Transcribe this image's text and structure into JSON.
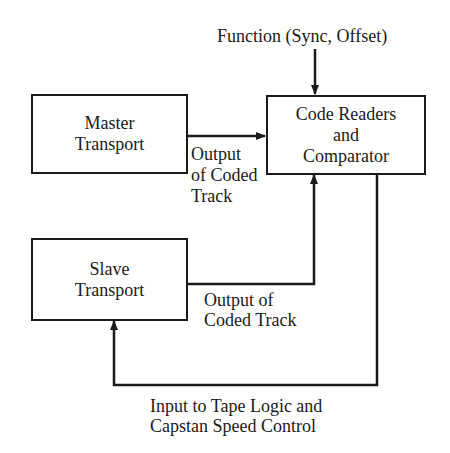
{
  "diagram": {
    "line_color": "#1a1a1a",
    "nodes": [
      {
        "id": "master",
        "lines": [
          "Master",
          "Transport"
        ]
      },
      {
        "id": "code",
        "lines": [
          "Code Readers",
          "and",
          "Comparator"
        ]
      },
      {
        "id": "slave",
        "lines": [
          "Slave",
          "Transport"
        ]
      }
    ],
    "labels": {
      "function": "Function (Sync, Offset)",
      "master_output": [
        "Output",
        "of Coded",
        "Track"
      ],
      "slave_output": [
        "Output of",
        "Coded Track"
      ],
      "feedback": [
        "Input to Tape Logic and",
        "Capstan Speed Control"
      ]
    },
    "edges": [
      {
        "from": "function",
        "to": "code",
        "label": "Function (Sync, Offset)"
      },
      {
        "from": "master",
        "to": "code",
        "label": "Output of Coded Track"
      },
      {
        "from": "slave",
        "to": "code",
        "label": "Output of Coded Track"
      },
      {
        "from": "code",
        "to": "slave",
        "label": "Input to Tape Logic and Capstan Speed Control"
      }
    ]
  }
}
